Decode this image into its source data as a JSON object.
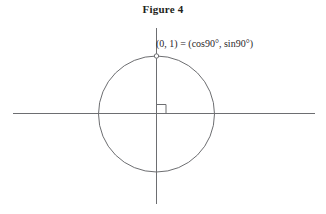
{
  "figure": {
    "title": "Figure 4",
    "point_label": "(0, 1) = (cos90°, sin90°)",
    "colors": {
      "background": "#ffffff",
      "stroke": "#6d6e71",
      "text": "#231f20"
    },
    "geometry": {
      "circle": {
        "center_x": 156,
        "center_y": 114,
        "radius": 58
      },
      "x_axis": {
        "x1": 13,
        "y1": 113,
        "x2": 315,
        "y2": 113
      },
      "y_axis": {
        "x1": 156,
        "y1": 28,
        "x2": 156,
        "y2": 204
      },
      "point": {
        "x": 156,
        "y": 56,
        "marker": "open-circle",
        "radius": 2.2
      },
      "right_angle_marker": {
        "x": 156,
        "y": 113,
        "size": 9,
        "quadrant": "I"
      }
    },
    "semantics": {
      "point_coordinates": [
        0,
        1
      ],
      "angle_degrees": 90,
      "cos_value": 0,
      "sin_value": 1,
      "unit_circle": true
    }
  }
}
